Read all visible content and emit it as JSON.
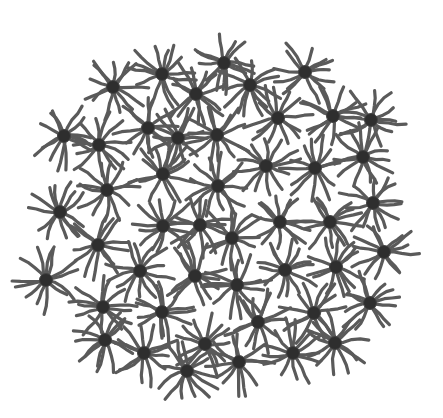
{
  "figure": {
    "width": 443,
    "height": 418,
    "colors": {
      "background": "#ffffff",
      "arm": "#5a5a5a",
      "core": "#2e2e2e",
      "core_edge": "#444444"
    },
    "arm_count": 13,
    "arm_length": 30,
    "arm_width": 3.2,
    "core_radius": 6.5,
    "stars": [
      {
        "x": 162,
        "y": 74
      },
      {
        "x": 224,
        "y": 63
      },
      {
        "x": 305,
        "y": 72
      },
      {
        "x": 113,
        "y": 87
      },
      {
        "x": 196,
        "y": 94
      },
      {
        "x": 250,
        "y": 85
      },
      {
        "x": 64,
        "y": 136
      },
      {
        "x": 99,
        "y": 145
      },
      {
        "x": 148,
        "y": 128
      },
      {
        "x": 178,
        "y": 138
      },
      {
        "x": 217,
        "y": 135
      },
      {
        "x": 278,
        "y": 118
      },
      {
        "x": 333,
        "y": 116
      },
      {
        "x": 371,
        "y": 120
      },
      {
        "x": 107,
        "y": 190
      },
      {
        "x": 163,
        "y": 174
      },
      {
        "x": 218,
        "y": 186
      },
      {
        "x": 266,
        "y": 166
      },
      {
        "x": 315,
        "y": 168
      },
      {
        "x": 363,
        "y": 157
      },
      {
        "x": 60,
        "y": 212
      },
      {
        "x": 163,
        "y": 226
      },
      {
        "x": 200,
        "y": 225
      },
      {
        "x": 232,
        "y": 238
      },
      {
        "x": 280,
        "y": 222
      },
      {
        "x": 330,
        "y": 222
      },
      {
        "x": 373,
        "y": 203
      },
      {
        "x": 98,
        "y": 245
      },
      {
        "x": 140,
        "y": 271
      },
      {
        "x": 195,
        "y": 276
      },
      {
        "x": 237,
        "y": 285
      },
      {
        "x": 285,
        "y": 270
      },
      {
        "x": 336,
        "y": 267
      },
      {
        "x": 384,
        "y": 252
      },
      {
        "x": 46,
        "y": 280
      },
      {
        "x": 103,
        "y": 307
      },
      {
        "x": 162,
        "y": 312
      },
      {
        "x": 205,
        "y": 344
      },
      {
        "x": 258,
        "y": 322
      },
      {
        "x": 314,
        "y": 313
      },
      {
        "x": 370,
        "y": 303
      },
      {
        "x": 105,
        "y": 340
      },
      {
        "x": 144,
        "y": 353
      },
      {
        "x": 187,
        "y": 371
      },
      {
        "x": 239,
        "y": 362
      },
      {
        "x": 293,
        "y": 353
      },
      {
        "x": 335,
        "y": 343
      }
    ]
  }
}
